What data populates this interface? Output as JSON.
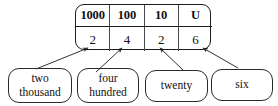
{
  "figure": {
    "colors": {
      "background": "#ffffff",
      "line": "#1a1a1a",
      "divider": "#4a4a4a",
      "text": "#111111",
      "arrow": "#333333"
    }
  },
  "table": {
    "headers": [
      "1000",
      "100",
      "10",
      "U"
    ],
    "digits": [
      "2",
      "4",
      "2",
      "6"
    ]
  },
  "callouts": [
    {
      "id": "thousands",
      "line1": "two",
      "line2": "thousand"
    },
    {
      "id": "hundreds",
      "line1": "four",
      "line2": "hundred"
    },
    {
      "id": "tens",
      "line1": "twenty",
      "line2": ""
    },
    {
      "id": "units",
      "line1": "six",
      "line2": ""
    }
  ]
}
